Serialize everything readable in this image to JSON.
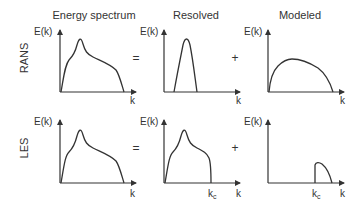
{
  "columns": [
    {
      "title": "Energy spectrum"
    },
    {
      "title": "Resolved"
    },
    {
      "title": "Modeled"
    }
  ],
  "rows": [
    {
      "label": "RANS"
    },
    {
      "label": "LES"
    }
  ],
  "axes": {
    "y_label": "E(k)",
    "x_label": "k",
    "cutoff_label": "k",
    "cutoff_subscript": "c"
  },
  "operators": {
    "equals": "=",
    "plus": "+"
  },
  "colors": {
    "stroke": "#333333",
    "background": "#ffffff"
  }
}
